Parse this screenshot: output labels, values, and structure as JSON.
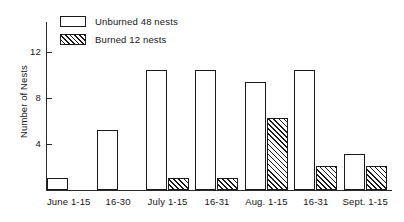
{
  "chart_data": {
    "type": "bar",
    "title": "",
    "xlabel": "",
    "ylabel": "Number of Nests",
    "ylim": [
      0,
      14
    ],
    "y_ticks": [
      4,
      8,
      12
    ],
    "grid": false,
    "legend_position": "top-left",
    "categories": [
      "June 1-15",
      "16-30",
      "July 1-15",
      "16-31",
      "Aug. 1-15",
      "16-31",
      "Sept. 1-15"
    ],
    "series": [
      {
        "name": "Unburned 48 nests",
        "short_name": "Unburned",
        "style": "open",
        "values": [
          1,
          5,
          10,
          10,
          9,
          10,
          3
        ]
      },
      {
        "name": "Burned 12 nests",
        "short_name": "Burned",
        "style": "hatched",
        "values": [
          0,
          0,
          1,
          1,
          6,
          2,
          2
        ]
      }
    ]
  },
  "legend": {
    "items": [
      {
        "label": "Unburned 48 nests",
        "swatch": "open-rect-icon"
      },
      {
        "label": "Burned 12 nests",
        "swatch": "hatched-rect-icon"
      }
    ]
  },
  "axes": {
    "y_title": "Number of Nests",
    "y_tick_labels": [
      "12",
      "8",
      "4"
    ]
  },
  "colors": {
    "ink": "#1a1a1a",
    "background": "#ffffff"
  }
}
